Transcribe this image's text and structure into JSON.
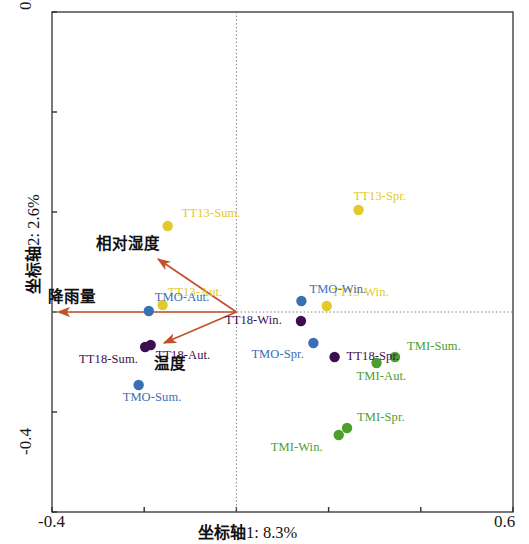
{
  "chart_data": {
    "type": "scatter",
    "title": "",
    "xlabel": "坐标轴1: 8.3%",
    "ylabel": "坐标轴2: 2.6%",
    "xlim": [
      -0.4,
      0.6
    ],
    "ylim": [
      -0.4,
      0.6
    ],
    "x_tick_labels": [
      "-0.4",
      "0.6"
    ],
    "y_tick_labels": [
      "0.6",
      "-0.4"
    ],
    "grid": false,
    "origin_lines": "dotted crosshair at x=0 and y=0",
    "legend_position": "none",
    "groups": [
      {
        "name": "TT13",
        "color": "#E3C92C"
      },
      {
        "name": "TT18",
        "color": "#3D0E4E"
      },
      {
        "name": "TMO",
        "color": "#3A6FB5"
      },
      {
        "name": "TMI",
        "color": "#4E9E2E"
      }
    ],
    "points": [
      {
        "label": "TT13-Sum.",
        "x": -0.149,
        "y": 0.172,
        "group": "TT13",
        "color": "#E3C92C",
        "label_dx": 14,
        "label_dy": -20
      },
      {
        "label": "TT13-Aut.",
        "x": -0.16,
        "y": 0.014,
        "group": "TT13",
        "color": "#E3C92C",
        "label_dx": 5,
        "label_dy": -20
      },
      {
        "label": "TT13-Spr.",
        "x": 0.265,
        "y": 0.204,
        "group": "TT13",
        "color": "#E3C92C",
        "label_dx": -5,
        "label_dy": -21
      },
      {
        "label": "TT13-Win.",
        "x": 0.196,
        "y": 0.012,
        "group": "TT13",
        "color": "#E3C92C",
        "label_dx": 5,
        "label_dy": -21
      },
      {
        "label": "TT18-Spr.",
        "x": 0.213,
        "y": -0.09,
        "group": "TT18",
        "color": "#3D0E4E",
        "label_dx": 12,
        "label_dy": -8
      },
      {
        "label": "TT18-Sum.",
        "x": -0.198,
        "y": -0.07,
        "group": "TT18",
        "color": "#3D0E4E",
        "label_dx": -66,
        "label_dy": 5
      },
      {
        "label": "TT18-Aut.",
        "x": -0.186,
        "y": -0.066,
        "group": "TT18",
        "color": "#3D0E4E",
        "label_dx": 5,
        "label_dy": 3
      },
      {
        "label": "TT18-Win.",
        "x": 0.14,
        "y": -0.018,
        "group": "TT18",
        "color": "#3D0E4E",
        "label_dx": -76,
        "label_dy": -8
      },
      {
        "label": "TMO-Aut.",
        "x": -0.19,
        "y": 0.002,
        "group": "TMO",
        "color": "#3A6FB5",
        "label_dx": 6,
        "label_dy": -21
      },
      {
        "label": "TMO-Sum.",
        "x": -0.212,
        "y": -0.146,
        "group": "TMO",
        "color": "#3A6FB5",
        "label_dx": -16,
        "label_dy": 5
      },
      {
        "label": "TMO-Win.",
        "x": 0.141,
        "y": 0.022,
        "group": "TMO",
        "color": "#3A6FB5",
        "label_dx": 8,
        "label_dy": -19
      },
      {
        "label": "TMO-Spr.",
        "x": 0.167,
        "y": -0.062,
        "group": "TMO",
        "color": "#3A6FB5",
        "label_dx": -62,
        "label_dy": 4
      },
      {
        "label": "TMI-Sum.",
        "x": 0.344,
        "y": -0.09,
        "group": "TMI",
        "color": "#4E9E2E",
        "label_dx": 12,
        "label_dy": -18
      },
      {
        "label": "TMI-Aut.",
        "x": 0.304,
        "y": -0.102,
        "group": "TMI",
        "color": "#4E9E2E",
        "label_dx": -20,
        "label_dy": 6
      },
      {
        "label": "TMI-Spr.",
        "x": 0.24,
        "y": -0.232,
        "group": "TMI",
        "color": "#4E9E2E",
        "label_dx": 10,
        "label_dy": -18
      },
      {
        "label": "TMI-Win.",
        "x": 0.222,
        "y": -0.246,
        "group": "TMI",
        "color": "#4E9E2E",
        "label_dx": -68,
        "label_dy": 5
      }
    ],
    "vectors": [
      {
        "label": "相对湿度",
        "x": -0.17,
        "y": 0.106,
        "color": "#C0522A",
        "label_dx": -62,
        "label_dy": -28
      },
      {
        "label": "降雨量",
        "x": -0.387,
        "y": 0.0,
        "color": "#C0522A",
        "label_dx": -10,
        "label_dy": -28
      },
      {
        "label": "温度",
        "x": -0.157,
        "y": -0.062,
        "color": "#C0522A",
        "label_dx": -10,
        "label_dy": 8
      }
    ]
  },
  "axes": {
    "x_title": "坐标轴1: 8.3%",
    "y_title": "坐标轴2: 2.6%",
    "x_min_label": "-0.4",
    "x_max_label": "0.6",
    "y_min_label": "-0.4",
    "y_max_label": "0.6"
  }
}
